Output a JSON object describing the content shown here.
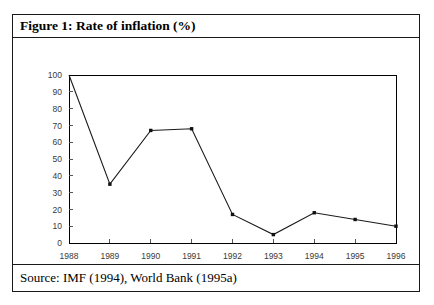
{
  "figure": {
    "title": "Figure 1: Rate of inflation (%)",
    "source": "Source: IMF (1994), World Bank (1995a)"
  },
  "chart_data": {
    "type": "line",
    "title": "Rate of inflation (%)",
    "xlabel": "",
    "ylabel": "",
    "x": [
      1988,
      1989,
      1990,
      1991,
      1992,
      1993,
      1994,
      1995,
      1996
    ],
    "categories": [
      "1988",
      "1989",
      "1990",
      "1991",
      "1992",
      "1993",
      "1994",
      "1995",
      "1996"
    ],
    "values": [
      null,
      35,
      67,
      68,
      17,
      5,
      18,
      14,
      10
    ],
    "series": [
      {
        "name": "Rate of inflation (%)",
        "values": [
          null,
          35,
          67,
          68,
          17,
          5,
          18,
          14,
          10
        ]
      }
    ],
    "ylim": [
      0,
      100
    ],
    "xlim": [
      1988,
      1996
    ],
    "yticks": [
      0,
      10,
      20,
      30,
      40,
      50,
      60,
      70,
      80,
      90,
      100
    ],
    "ytick_labels": [
      "0",
      "10",
      "20",
      "30",
      "40",
      "50",
      "60",
      "70",
      "80",
      "90",
      "100"
    ],
    "xticks": [
      1988,
      1989,
      1990,
      1991,
      1992,
      1993,
      1994,
      1995,
      1996
    ],
    "xtick_labels": [
      "1988",
      "1989",
      "1990",
      "1991",
      "1992",
      "1993",
      "1994",
      "1995",
      "1996"
    ],
    "grid": false,
    "legend": false,
    "legend_position": "none",
    "line_color": "#1a1a1a",
    "marker_color": "#111111",
    "background_color": "#ffffff",
    "border_color": "#1a1a1a"
  }
}
